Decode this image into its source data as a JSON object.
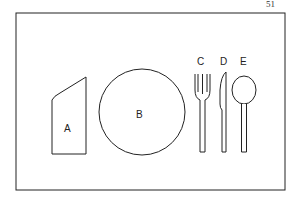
{
  "page_number": "51",
  "diagram": {
    "items": [
      {
        "label": "A",
        "name": "napkin"
      },
      {
        "label": "B",
        "name": "plate"
      },
      {
        "label": "C",
        "name": "fork"
      },
      {
        "label": "D",
        "name": "knife"
      },
      {
        "label": "E",
        "name": "spoon"
      }
    ]
  },
  "colors": {
    "stroke": "#222222",
    "background": "#ffffff"
  }
}
